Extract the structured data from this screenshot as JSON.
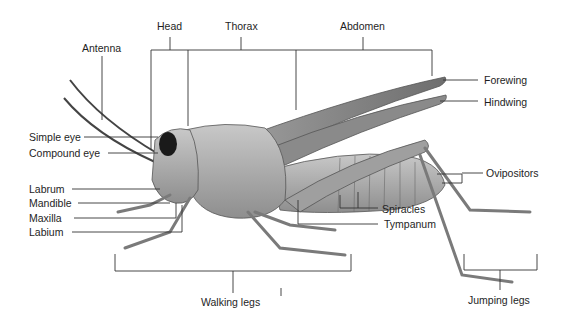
{
  "diagram": {
    "colors": {
      "background": "#ffffff",
      "lines": "#333333",
      "body": "#a9a9a9",
      "text": "#1e1e1e"
    },
    "region_labels": {
      "head": "Head",
      "thorax": "Thorax",
      "abdomen": "Abdomen"
    },
    "left_labels": {
      "antenna": "Antenna",
      "simple_eye": "Simple eye",
      "compound_eye": "Compound eye",
      "labrum": "Labrum",
      "mandible": "Mandible",
      "maxilla": "Maxilla",
      "labium": "Labium"
    },
    "right_labels": {
      "forewing": "Forewing",
      "hindwing": "Hindwing",
      "ovipositors": "Ovipositors",
      "spiracles": "Spiracles",
      "tympanum": "Tympanum"
    },
    "bottom_labels": {
      "walking_legs": "Walking legs",
      "jumping_legs": "Jumping legs"
    }
  }
}
